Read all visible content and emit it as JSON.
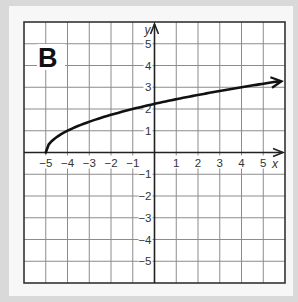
{
  "panel": {
    "label": "B"
  },
  "chart_data": {
    "type": "line",
    "title": "B",
    "xlabel": "x",
    "ylabel": "y",
    "xlim": [
      -6,
      6
    ],
    "ylim": [
      -6,
      6
    ],
    "grid": true,
    "x_ticks": [
      "-5",
      "-4",
      "-3",
      "-2",
      "-1",
      "1",
      "2",
      "3",
      "4",
      "5"
    ],
    "y_ticks": [
      "5",
      "4",
      "3",
      "2",
      "1",
      "-1",
      "-2",
      "-3",
      "-4",
      "-5"
    ],
    "function": "y = sqrt(x + 5)",
    "series": [
      {
        "name": "curve",
        "x": [
          -5,
          -4.75,
          -4.5,
          -4,
          -3,
          -2,
          -1,
          0,
          1,
          2,
          3,
          4,
          5,
          5.8
        ],
        "y": [
          0,
          0.5,
          0.71,
          1,
          1.41,
          1.73,
          2,
          2.24,
          2.45,
          2.65,
          2.83,
          3,
          3.16,
          3.29
        ],
        "start": "closed endpoint at (-5, 0)",
        "end": "arrow"
      }
    ]
  },
  "colors": {
    "grid": "#8c8c8c",
    "axis": "#222222",
    "curve": "#111111",
    "frame": "#d9d9d9",
    "panel": "#f7f7f7"
  }
}
